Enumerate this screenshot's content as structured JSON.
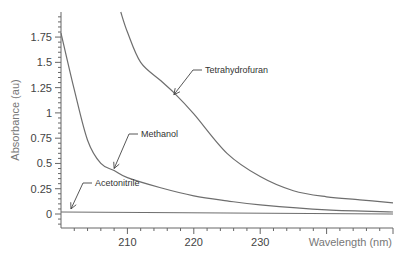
{
  "chart_data": {
    "type": "line",
    "title": "",
    "xlabel": "Wavelength (nm)",
    "ylabel": "Absorbance (au)",
    "xlim": [
      200,
      250
    ],
    "ylim": [
      -0.12,
      1.98
    ],
    "x_ticks": [
      210,
      220,
      230
    ],
    "y_ticks": [
      0,
      0.25,
      0.5,
      0.75,
      1,
      1.25,
      1.5,
      1.75
    ],
    "y_tick_labels": [
      "0",
      "0.25",
      "0.5",
      "0.75",
      "1",
      "1.25",
      "1.5",
      "1.75"
    ],
    "grid": false,
    "legend": "none (inline annotations with arrows)",
    "series": [
      {
        "name": "Tetrahydrofuran",
        "x": [
          209,
          210,
          212,
          215,
          217,
          220,
          225,
          230,
          235,
          240,
          245,
          250
        ],
        "values": [
          2.0,
          1.8,
          1.5,
          1.32,
          1.2,
          0.99,
          0.6,
          0.37,
          0.23,
          0.17,
          0.14,
          0.11
        ]
      },
      {
        "name": "Methanol",
        "x": [
          200,
          202,
          204,
          206,
          208,
          210,
          215,
          220,
          225,
          230,
          240,
          250
        ],
        "values": [
          1.79,
          1.23,
          0.73,
          0.5,
          0.43,
          0.36,
          0.26,
          0.18,
          0.13,
          0.09,
          0.04,
          0.02
        ]
      },
      {
        "name": "Acetonitrile",
        "x": [
          200,
          250
        ],
        "values": [
          0.02,
          0.0
        ]
      }
    ],
    "annotations": [
      {
        "text": "Tetrahydrofuran",
        "points_to_x": 217,
        "points_to_y": 1.18
      },
      {
        "text": "Methanol",
        "points_to_x": 208,
        "points_to_y": 0.45
      },
      {
        "text": "Acetonitrile",
        "points_to_x": 201.5,
        "points_to_y": 0.05
      }
    ]
  }
}
